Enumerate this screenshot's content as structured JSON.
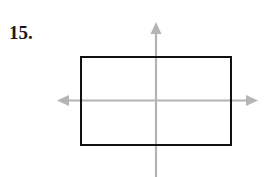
{
  "page": {
    "width": 273,
    "height": 177,
    "background_color": "#ffffff"
  },
  "problem": {
    "number_label": "15.",
    "label_color": "#1a1a1a"
  },
  "figure": {
    "rectangle": {
      "stroke_color": "#111111",
      "fill_color": "#ffffff",
      "stroke_width": 2,
      "x": 80,
      "y": 56,
      "width": 152,
      "height": 90
    },
    "axes": {
      "stroke_color": "#b3b3b3",
      "stroke_width": 2,
      "arrowhead_color": "#b3b3b3",
      "origin_x": 156,
      "origin_y": 100,
      "horizontal": {
        "x_start": 58,
        "x_end": 256,
        "y": 100,
        "arrow_left": true,
        "arrow_right": true
      },
      "vertical": {
        "y_start": 24,
        "y_end": 177,
        "x": 156,
        "arrow_up": true,
        "arrow_down": false
      }
    }
  }
}
